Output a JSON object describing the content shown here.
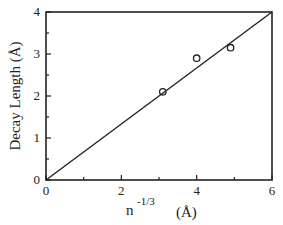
{
  "chart_data": {
    "type": "scatter",
    "title": "",
    "xlabel": "n^-1/3 (Å)",
    "xlabel_base": "n",
    "xlabel_exp": "-1/3",
    "xlabel_unit": "(Å)",
    "ylabel": "Decay Length (Å)",
    "xlim": [
      0,
      6
    ],
    "ylim": [
      0,
      4
    ],
    "xticks": [
      "0",
      "2",
      "4",
      "6"
    ],
    "yticks": [
      "0",
      "1",
      "2",
      "3",
      "4"
    ],
    "grid": false,
    "legend": null,
    "series": [
      {
        "name": "data",
        "style": "open-circle",
        "x": [
          3.1,
          4.0,
          4.9
        ],
        "y": [
          2.1,
          2.9,
          3.15
        ]
      },
      {
        "name": "fit",
        "style": "line",
        "x": [
          0,
          6
        ],
        "y": [
          0,
          4
        ]
      }
    ]
  }
}
